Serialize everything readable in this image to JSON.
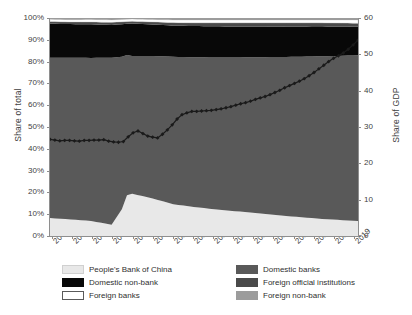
{
  "chart_data": {
    "type": "area",
    "title": "",
    "subtitle": "",
    "xlabel": "",
    "ylabel": "Share of total",
    "y2label": "Share of GDP",
    "ylim": [
      0,
      100
    ],
    "y2lim": [
      0,
      60
    ],
    "grid": false,
    "legend_position": "bottom",
    "stacked": "percent",
    "x": [
      2004,
      2005,
      2006,
      2007,
      2008,
      2009,
      2010,
      2011,
      2012,
      2013,
      2014,
      2015,
      2016,
      2017,
      2018,
      2019
    ],
    "xtick_labels": [
      "2004",
      "2005",
      "2006",
      "2007",
      "2008",
      "2009",
      "2010",
      "2011",
      "2012",
      "2013",
      "2014",
      "2015",
      "2016",
      "2017",
      "2018",
      "2019"
    ],
    "ytick_labels": [
      "0%",
      "10%",
      "20%",
      "30%",
      "40%",
      "50%",
      "60%",
      "70%",
      "80%",
      "90%",
      "100%"
    ],
    "ytick_values": [
      0,
      10,
      20,
      30,
      40,
      50,
      60,
      70,
      80,
      90,
      100
    ],
    "y2tick_labels": [
      "0",
      "10",
      "20",
      "30",
      "40",
      "50",
      "60"
    ],
    "y2tick_values": [
      0,
      10,
      20,
      30,
      40,
      50,
      60
    ],
    "series": [
      {
        "name": "People's Bank of China",
        "color": "#e8e8e8",
        "stack_order": 1,
        "values": [
          8.2,
          7.6,
          6.9,
          5.2,
          19.4,
          17.2,
          14.6,
          13.3,
          12.3,
          11.4,
          10.6,
          9.6,
          8.8,
          8.0,
          7.4,
          6.9
        ]
      },
      {
        "name": "Domestic banks",
        "color": "#595959",
        "stack_order": 2,
        "values": [
          73.6,
          74.2,
          74.8,
          76.6,
          63.2,
          65.4,
          67.6,
          68.7,
          69.6,
          70.5,
          71.4,
          72.5,
          73.4,
          74.4,
          75.2,
          76.0
        ]
      },
      {
        "name": "Domestic non-bank",
        "color": "#080808",
        "stack_order": 3,
        "values": [
          15.6,
          15.4,
          15.4,
          15.0,
          14.9,
          14.4,
          14.3,
          14.3,
          14.3,
          14.2,
          14.1,
          13.9,
          13.9,
          13.8,
          13.5,
          13.1
        ]
      },
      {
        "name": "Foreign official institutions",
        "color": "#4a4a4a",
        "stack_order": 4,
        "values": [
          1.0,
          1.0,
          1.1,
          1.2,
          1.0,
          1.2,
          1.4,
          1.5,
          1.6,
          1.7,
          1.7,
          1.8,
          1.7,
          1.6,
          1.6,
          1.6
        ]
      },
      {
        "name": "Foreign banks",
        "color": "#ffffff",
        "stack_order": 5,
        "values": [
          1.0,
          1.0,
          1.1,
          1.1,
          1.0,
          1.1,
          1.2,
          1.3,
          1.3,
          1.3,
          1.3,
          1.3,
          1.3,
          1.3,
          1.4,
          1.5
        ]
      },
      {
        "name": "Foreign non-bank",
        "color": "#9c9c9c",
        "stack_order": 6,
        "values": [
          0.6,
          0.8,
          0.7,
          0.9,
          0.5,
          0.7,
          0.9,
          0.9,
          0.9,
          0.9,
          0.9,
          0.9,
          0.9,
          0.9,
          0.9,
          0.9
        ]
      }
    ],
    "line_series": {
      "name": "Total (share of GDP)",
      "axis": "y2",
      "color": "#1a1a1a",
      "marker": "diamond",
      "quarterly_values": [
        26.6,
        26.4,
        26.2,
        26.3,
        26.3,
        26.2,
        26.1,
        26.3,
        26.3,
        26.4,
        26.4,
        26.5,
        26.1,
        25.9,
        25.8,
        26.0,
        27.3,
        28.4,
        28.9,
        28.2,
        27.5,
        27.2,
        27.0,
        28.0,
        29.2,
        30.6,
        32.2,
        33.4,
        33.9,
        34.3,
        34.3,
        34.4,
        34.5,
        34.6,
        34.8,
        35.0,
        35.3,
        35.6,
        36.0,
        36.4,
        36.7,
        37.1,
        37.6,
        38.0,
        38.4,
        38.9,
        39.5,
        40.1,
        40.8,
        41.4,
        42.0,
        42.6,
        43.3,
        44.1,
        45.0,
        46.0,
        47.0,
        48.0,
        48.9,
        49.6,
        50.4,
        51.4,
        52.6,
        53.9
      ]
    }
  },
  "legend": {
    "columns": [
      {
        "items": [
          {
            "label": "People's Bank of China",
            "color": "#e8e8e8",
            "border": "#d0d0d0"
          },
          {
            "label": "Domestic non-bank",
            "color": "#080808",
            "border": "#080808"
          },
          {
            "label": "Foreign banks",
            "color": "#ffffff",
            "border": "#5a5a5a"
          }
        ]
      },
      {
        "items": [
          {
            "label": "Domestic banks",
            "color": "#595959",
            "border": "#595959"
          },
          {
            "label": "Foreign official institutions",
            "color": "#4a4a4a",
            "border": "#4a4a4a"
          },
          {
            "label": "Foreign non-bank",
            "color": "#9c9c9c",
            "border": "#9c9c9c"
          }
        ]
      }
    ]
  }
}
